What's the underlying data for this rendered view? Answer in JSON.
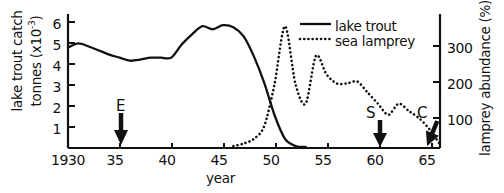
{
  "chart_data": {
    "type": "line",
    "title": "",
    "xlabel": "year",
    "ylabel_left": "lake trout catch tonnes (x10-3)",
    "ylabel_left_line1": "lake trout catch",
    "ylabel_left_line2": "tonnes (x10",
    "ylabel_left_exponent": "-3",
    "ylabel_left_close": ")",
    "ylabel_right": "lamprey abundance (%)",
    "xlim": [
      1930,
      1966
    ],
    "ylim_left": [
      0,
      6.6
    ],
    "ylim_right": [
      0,
      363
    ],
    "grid": false,
    "legend_position": "top-right",
    "xticks": [
      1930,
      1935,
      1940,
      1945,
      1950,
      1955,
      1960,
      1965
    ],
    "xtick_labels": [
      "1930",
      "35",
      "40",
      "45",
      "50",
      "55",
      "60",
      "65"
    ],
    "yticks_left": [
      1,
      2,
      3,
      4,
      5,
      6
    ],
    "ytick_labels_left": [
      "1",
      "2",
      "3",
      "4",
      "5",
      "6"
    ],
    "yticks_right": [
      100,
      200,
      300
    ],
    "ytick_labels_right": [
      "100",
      "200",
      "300"
    ],
    "series": [
      {
        "name": "lake trout",
        "style": "solid",
        "axis": "left",
        "color": "#111111",
        "x": [
          1930,
          1931,
          1932,
          1933,
          1934,
          1935,
          1936,
          1937,
          1938,
          1939,
          1940,
          1941,
          1942,
          1943,
          1944,
          1945,
          1946,
          1947,
          1948,
          1949,
          1950,
          1951,
          1952,
          1953
        ],
        "values": [
          4.95,
          5.15,
          5.0,
          4.8,
          4.6,
          4.45,
          4.3,
          4.35,
          4.45,
          4.45,
          4.45,
          5.1,
          5.6,
          6.0,
          5.85,
          6.05,
          5.95,
          5.5,
          4.5,
          3.2,
          1.6,
          0.45,
          0.1,
          0.05
        ]
      },
      {
        "name": "sea lamprey",
        "style": "dotted",
        "axis": "right",
        "color": "#111111",
        "x": [
          1946,
          1947,
          1948,
          1949,
          1950,
          1951,
          1952,
          1953,
          1954,
          1955,
          1956,
          1957,
          1958,
          1959,
          1960,
          1961,
          1962,
          1963,
          1964,
          1965,
          1966
        ],
        "values": [
          5,
          12,
          25,
          60,
          175,
          330,
          175,
          120,
          250,
          200,
          175,
          175,
          180,
          150,
          120,
          90,
          120,
          100,
          80,
          50,
          10
        ]
      }
    ],
    "legend": [
      {
        "label": "lake trout",
        "style": "solid"
      },
      {
        "label": "sea lamprey",
        "style": "dotted"
      }
    ],
    "annotations": [
      {
        "label": "E",
        "x": 1936,
        "type": "down-arrow"
      },
      {
        "label": "S",
        "x": 1960,
        "type": "down-arrow"
      },
      {
        "label": "C",
        "x": 1965.6,
        "type": "down-arrow-slanted"
      }
    ]
  }
}
